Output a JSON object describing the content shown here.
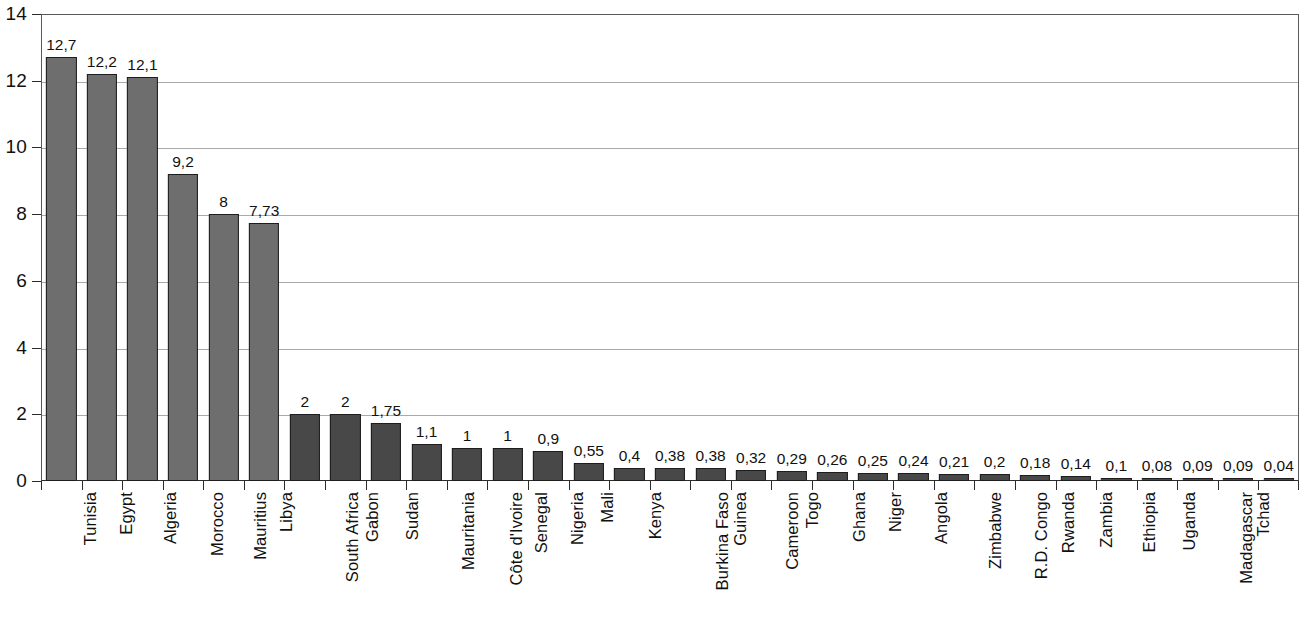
{
  "chart_data": {
    "type": "bar",
    "title": "",
    "subtitle": "",
    "xlabel": "",
    "ylabel": "",
    "ylim": [
      0,
      14
    ],
    "ytick_labels": [
      "0",
      "2",
      "4",
      "6",
      "8",
      "10",
      "12",
      "14"
    ],
    "ytick_values": [
      0,
      2,
      4,
      6,
      8,
      10,
      12,
      14
    ],
    "grid": "horizontal",
    "legend": "none",
    "decimal_separator": ",",
    "categories": [
      "Tunisia",
      "Egypt",
      "Algeria",
      "Morocco",
      "Mauritius",
      "Libya",
      "South Africa",
      "Gabon",
      "Sudan",
      "Mauritania",
      "Côte d'Ivoire",
      "Senegal",
      "Nigeria",
      "Mali",
      "Kenya",
      "Burkina Faso",
      "Guinea",
      "Cameroon",
      "Togo",
      "Ghana",
      "Niger",
      "Angola",
      "Zimbabwe",
      "R.D. Congo",
      "Rwanda",
      "Zambia",
      "Ethiopia",
      "Uganda",
      "Madagascar",
      "Tchad",
      "Tanzania"
    ],
    "values": [
      12.7,
      12.2,
      12.1,
      9.2,
      8,
      7.73,
      2,
      2,
      1.75,
      1.1,
      1,
      1,
      0.9,
      0.55,
      0.4,
      0.38,
      0.38,
      0.32,
      0.29,
      0.26,
      0.25,
      0.24,
      0.21,
      0.2,
      0.18,
      0.14,
      0.1,
      0.08,
      0.09,
      0.09,
      0.04
    ],
    "value_labels": [
      "12,7",
      "12,2",
      "12,1",
      "9,2",
      "8",
      "7,73",
      "2",
      "2",
      "1,75",
      "1,1",
      "1",
      "1",
      "0,9",
      "0,55",
      "0,4",
      "0,38",
      "0,38",
      "0,32",
      "0,29",
      "0,26",
      "0,25",
      "0,24",
      "0,21",
      "0,2",
      "0,18",
      "0,14",
      "0,1",
      "0,08",
      "0,09",
      "0,09",
      "0,04"
    ],
    "bar_group_index": [
      0,
      0,
      0,
      0,
      0,
      0,
      1,
      1,
      1,
      1,
      1,
      1,
      1,
      1,
      1,
      1,
      1,
      1,
      1,
      1,
      1,
      1,
      1,
      1,
      1,
      1,
      1,
      1,
      1,
      1,
      1
    ],
    "colors": {
      "bar_group_light": "#6e6e6e",
      "bar_group_dark": "#484848",
      "bar_outline": "#1d1d1d",
      "gridline": "#a9a9a9",
      "axis": "#2b2b2b",
      "text": "#111111",
      "background": "#ffffff"
    }
  }
}
